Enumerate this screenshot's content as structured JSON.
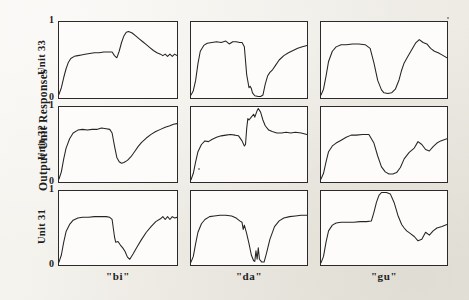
{
  "figure": {
    "y_axis_title": "Output Unit Responses",
    "row_labels": [
      "Unit 33",
      "Unit 32",
      "Unit 31"
    ],
    "column_labels": [
      "\"bi\"",
      "\"da\"",
      "\"gu\""
    ],
    "tick_labels": {
      "top": "1",
      "bottom": "0"
    },
    "background_color": "#f3f1ec",
    "panel_color": "#fdfcfa",
    "trace_color": "#242424",
    "axis_color": "#2a2a2a"
  },
  "chart_data": {
    "type": "line",
    "title": "Output Unit Responses",
    "xlabel": "",
    "ylabel": "Output Unit Responses",
    "ylim": [
      0,
      1
    ],
    "xlim": [
      0,
      1
    ],
    "grid": false,
    "legend": "none",
    "layout": {
      "rows": 3,
      "cols": 3,
      "row_order": [
        "Unit 33",
        "Unit 32",
        "Unit 31"
      ],
      "col_order": [
        "\"bi\"",
        "\"da\"",
        "\"gu\""
      ]
    },
    "ytick_labels": [
      "0",
      "1"
    ],
    "ytick_values": [
      0,
      1
    ],
    "panels": [
      {
        "row": "Unit 33",
        "col": "\"bi\"",
        "x": [
          0.0,
          0.02,
          0.04,
          0.06,
          0.08,
          0.1,
          0.13,
          0.16,
          0.19,
          0.22,
          0.26,
          0.3,
          0.34,
          0.38,
          0.42,
          0.45,
          0.47,
          0.49,
          0.51,
          0.53,
          0.55,
          0.57,
          0.59,
          0.62,
          0.65,
          0.68,
          0.71,
          0.74,
          0.77,
          0.8,
          0.83,
          0.86,
          0.88,
          0.9,
          0.92,
          0.94,
          0.96,
          0.98,
          1.0
        ],
        "y": [
          0.03,
          0.12,
          0.26,
          0.38,
          0.47,
          0.52,
          0.55,
          0.56,
          0.57,
          0.58,
          0.59,
          0.6,
          0.6,
          0.61,
          0.61,
          0.61,
          0.56,
          0.53,
          0.62,
          0.74,
          0.83,
          0.88,
          0.89,
          0.87,
          0.83,
          0.79,
          0.75,
          0.71,
          0.67,
          0.63,
          0.6,
          0.58,
          0.56,
          0.58,
          0.55,
          0.58,
          0.55,
          0.58,
          0.56
        ]
      },
      {
        "row": "Unit 33",
        "col": "\"da\"",
        "x": [
          0.0,
          0.02,
          0.04,
          0.06,
          0.08,
          0.11,
          0.14,
          0.18,
          0.22,
          0.26,
          0.3,
          0.33,
          0.36,
          0.39,
          0.42,
          0.44,
          0.46,
          0.48,
          0.5,
          0.51,
          0.52,
          0.53,
          0.55,
          0.58,
          0.6,
          0.62,
          0.64,
          0.66,
          0.68,
          0.7,
          0.73,
          0.76,
          0.8,
          0.84,
          0.88,
          0.92,
          0.96,
          1.0
        ],
        "y": [
          0.02,
          0.08,
          0.22,
          0.45,
          0.62,
          0.7,
          0.73,
          0.74,
          0.75,
          0.74,
          0.76,
          0.72,
          0.75,
          0.75,
          0.74,
          0.74,
          0.68,
          0.3,
          0.12,
          0.14,
          0.11,
          0.05,
          0.01,
          0.0,
          0.0,
          0.02,
          0.17,
          0.28,
          0.33,
          0.36,
          0.43,
          0.5,
          0.56,
          0.6,
          0.63,
          0.66,
          0.68,
          0.7
        ]
      },
      {
        "row": "Unit 33",
        "col": "\"gu\"",
        "x": [
          0.0,
          0.02,
          0.04,
          0.06,
          0.09,
          0.12,
          0.16,
          0.2,
          0.25,
          0.3,
          0.35,
          0.39,
          0.42,
          0.45,
          0.48,
          0.5,
          0.53,
          0.56,
          0.59,
          0.62,
          0.64,
          0.66,
          0.69,
          0.72,
          0.75,
          0.78,
          0.81,
          0.84,
          0.87,
          0.9,
          0.93,
          0.96,
          1.0
        ],
        "y": [
          0.02,
          0.1,
          0.28,
          0.48,
          0.62,
          0.68,
          0.71,
          0.71,
          0.72,
          0.72,
          0.71,
          0.66,
          0.46,
          0.22,
          0.09,
          0.05,
          0.04,
          0.05,
          0.1,
          0.23,
          0.36,
          0.46,
          0.55,
          0.64,
          0.73,
          0.78,
          0.74,
          0.72,
          0.66,
          0.62,
          0.6,
          0.57,
          0.53
        ]
      },
      {
        "row": "Unit 32",
        "col": "\"bi\"",
        "x": [
          0.0,
          0.02,
          0.04,
          0.06,
          0.09,
          0.12,
          0.16,
          0.2,
          0.24,
          0.28,
          0.32,
          0.36,
          0.4,
          0.43,
          0.45,
          0.47,
          0.49,
          0.51,
          0.53,
          0.55,
          0.58,
          0.61,
          0.64,
          0.67,
          0.7,
          0.74,
          0.78,
          0.82,
          0.86,
          0.9,
          0.94,
          0.97,
          1.0
        ],
        "y": [
          0.02,
          0.12,
          0.3,
          0.45,
          0.58,
          0.66,
          0.7,
          0.71,
          0.7,
          0.71,
          0.71,
          0.73,
          0.72,
          0.71,
          0.66,
          0.48,
          0.32,
          0.26,
          0.24,
          0.25,
          0.28,
          0.33,
          0.4,
          0.47,
          0.53,
          0.59,
          0.64,
          0.68,
          0.71,
          0.74,
          0.76,
          0.78,
          0.79
        ]
      },
      {
        "row": "Unit 32",
        "col": "\"da\"",
        "x": [
          0.0,
          0.02,
          0.04,
          0.06,
          0.09,
          0.12,
          0.15,
          0.18,
          0.22,
          0.26,
          0.3,
          0.34,
          0.38,
          0.41,
          0.44,
          0.46,
          0.47,
          0.48,
          0.49,
          0.5,
          0.52,
          0.54,
          0.55,
          0.57,
          0.58,
          0.6,
          0.62,
          0.64,
          0.67,
          0.7,
          0.74,
          0.78,
          0.82,
          0.86,
          0.9,
          0.95,
          1.0
        ],
        "y": [
          0.01,
          0.1,
          0.26,
          0.4,
          0.5,
          0.55,
          0.54,
          0.57,
          0.6,
          0.62,
          0.63,
          0.64,
          0.63,
          0.62,
          0.55,
          0.48,
          0.5,
          0.72,
          0.86,
          0.84,
          0.88,
          0.92,
          0.88,
          0.97,
          1.0,
          0.95,
          0.84,
          0.76,
          0.7,
          0.68,
          0.66,
          0.66,
          0.67,
          0.66,
          0.67,
          0.66,
          0.64
        ]
      },
      {
        "row": "Unit 32",
        "col": "\"gu\"",
        "x": [
          0.0,
          0.02,
          0.04,
          0.06,
          0.09,
          0.12,
          0.16,
          0.2,
          0.24,
          0.28,
          0.33,
          0.38,
          0.42,
          0.45,
          0.48,
          0.51,
          0.54,
          0.57,
          0.6,
          0.63,
          0.66,
          0.7,
          0.74,
          0.77,
          0.8,
          0.83,
          0.86,
          0.89,
          0.92,
          0.95,
          1.0
        ],
        "y": [
          0.02,
          0.1,
          0.26,
          0.4,
          0.48,
          0.52,
          0.56,
          0.6,
          0.63,
          0.63,
          0.64,
          0.64,
          0.52,
          0.34,
          0.19,
          0.12,
          0.09,
          0.09,
          0.11,
          0.18,
          0.3,
          0.39,
          0.45,
          0.54,
          0.5,
          0.43,
          0.41,
          0.47,
          0.52,
          0.55,
          0.58
        ]
      },
      {
        "row": "Unit 31",
        "col": "\"bi\"",
        "x": [
          0.0,
          0.02,
          0.04,
          0.06,
          0.09,
          0.12,
          0.16,
          0.2,
          0.25,
          0.3,
          0.35,
          0.4,
          0.43,
          0.45,
          0.47,
          0.48,
          0.5,
          0.52,
          0.54,
          0.56,
          0.58,
          0.6,
          0.63,
          0.66,
          0.7,
          0.74,
          0.78,
          0.82,
          0.86,
          0.88,
          0.9,
          0.92,
          0.94,
          0.96,
          0.98,
          1.0
        ],
        "y": [
          0.02,
          0.12,
          0.3,
          0.45,
          0.55,
          0.61,
          0.64,
          0.65,
          0.65,
          0.66,
          0.66,
          0.66,
          0.65,
          0.62,
          0.38,
          0.3,
          0.31,
          0.26,
          0.22,
          0.17,
          0.09,
          0.06,
          0.14,
          0.23,
          0.34,
          0.44,
          0.52,
          0.59,
          0.63,
          0.66,
          0.62,
          0.66,
          0.62,
          0.66,
          0.64,
          0.65
        ]
      },
      {
        "row": "Unit 31",
        "col": "\"da\"",
        "x": [
          0.0,
          0.02,
          0.04,
          0.06,
          0.09,
          0.12,
          0.16,
          0.2,
          0.25,
          0.3,
          0.35,
          0.39,
          0.42,
          0.44,
          0.45,
          0.46,
          0.48,
          0.5,
          0.52,
          0.54,
          0.55,
          0.56,
          0.57,
          0.58,
          0.59,
          0.6,
          0.61,
          0.63,
          0.65,
          0.68,
          0.72,
          0.76,
          0.8,
          0.85,
          0.9,
          0.95,
          1.0
        ],
        "y": [
          0.02,
          0.1,
          0.28,
          0.44,
          0.56,
          0.62,
          0.66,
          0.67,
          0.68,
          0.68,
          0.67,
          0.64,
          0.6,
          0.58,
          0.48,
          0.54,
          0.42,
          0.28,
          0.12,
          0.04,
          0.03,
          0.18,
          0.06,
          0.22,
          0.06,
          0.04,
          0.02,
          0.02,
          0.14,
          0.34,
          0.52,
          0.6,
          0.64,
          0.66,
          0.67,
          0.68,
          0.68
        ]
      },
      {
        "row": "Unit 31",
        "col": "\"gu\"",
        "x": [
          0.0,
          0.02,
          0.04,
          0.06,
          0.09,
          0.12,
          0.16,
          0.21,
          0.26,
          0.31,
          0.36,
          0.4,
          0.42,
          0.44,
          0.46,
          0.48,
          0.5,
          0.52,
          0.55,
          0.58,
          0.61,
          0.64,
          0.66,
          0.68,
          0.71,
          0.74,
          0.77,
          0.8,
          0.83,
          0.86,
          0.89,
          0.92,
          0.96,
          1.0
        ],
        "y": [
          0.01,
          0.1,
          0.3,
          0.46,
          0.54,
          0.57,
          0.58,
          0.58,
          0.58,
          0.59,
          0.59,
          0.6,
          0.72,
          0.86,
          0.96,
          1.0,
          1.0,
          1.0,
          0.98,
          0.86,
          0.68,
          0.55,
          0.5,
          0.46,
          0.42,
          0.38,
          0.32,
          0.34,
          0.44,
          0.4,
          0.46,
          0.5,
          0.52,
          0.55
        ]
      }
    ]
  }
}
